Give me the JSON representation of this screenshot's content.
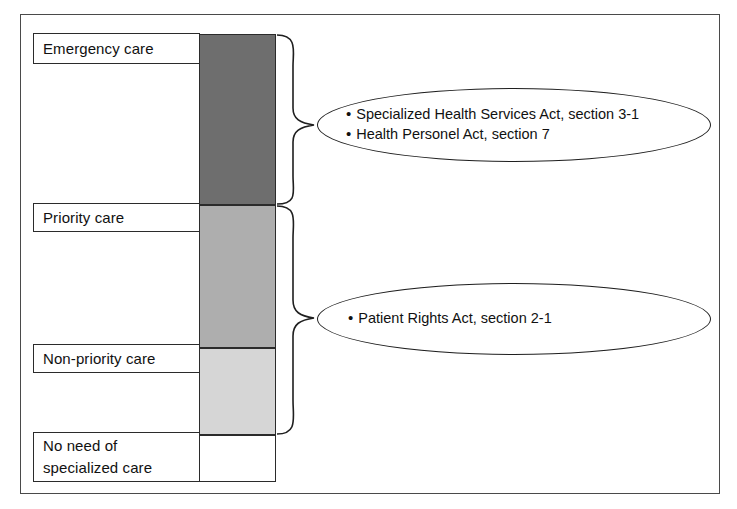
{
  "figure": {
    "frame": {
      "border_color": "#4a4a4a"
    }
  },
  "categories": [
    {
      "id": "emergency-care",
      "label": "Emergency care",
      "lines": [
        "Emergency care"
      ],
      "box": {
        "x": 33,
        "y": 33,
        "w": 167,
        "h": 31
      },
      "arrow_to_y": 48
    },
    {
      "id": "priority-care",
      "label": "Priority care",
      "lines": [
        "Priority care"
      ],
      "box": {
        "x": 33,
        "y": 203,
        "w": 167,
        "h": 29
      },
      "arrow_to_y": 217
    },
    {
      "id": "non-priority-care",
      "label": "Non-priority care",
      "lines": [
        "Non-priority care"
      ],
      "box": {
        "x": 33,
        "y": 344,
        "w": 167,
        "h": 29
      },
      "arrow_to_y": 358
    },
    {
      "id": "no-need-of-specialized-care",
      "label": "No need of specialized care",
      "lines": [
        "No need of",
        "specialized care"
      ],
      "box": {
        "x": 33,
        "y": 432,
        "w": 167,
        "h": 50
      },
      "arrow_to_y": 447
    }
  ],
  "bar": {
    "x": 199,
    "width": 77,
    "segments": [
      {
        "id": "emergency-segment",
        "y": 34,
        "height": 171,
        "fill": "#6e6e6e"
      },
      {
        "id": "priority-segment",
        "y": 205,
        "height": 143,
        "fill": "#aeaeae"
      },
      {
        "id": "non-priority-segment",
        "y": 348,
        "height": 87,
        "fill": "#d6d6d6"
      },
      {
        "id": "no-need-segment",
        "y": 435,
        "height": 47,
        "fill": "#ffffff"
      }
    ],
    "stroke": "#2b2b2b"
  },
  "braces": [
    {
      "id": "brace-emergency",
      "top": 34,
      "bottom": 205,
      "tip_y": 125
    },
    {
      "id": "brace-patient",
      "top": 205,
      "bottom": 435,
      "tip_y": 318
    }
  ],
  "callouts": [
    {
      "id": "acts-emergency",
      "items": [
        "Specialized Health Services Act, section 3-1",
        "Health Personel Act, section 7"
      ]
    },
    {
      "id": "acts-patient",
      "items": [
        "Patient Rights Act, section 2-1"
      ]
    }
  ],
  "bullet_glyph": "•"
}
